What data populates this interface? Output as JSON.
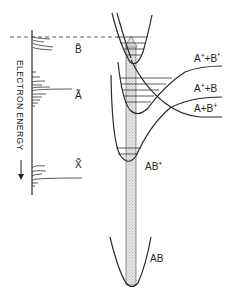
{
  "diagram": {
    "spectrum": {
      "axis_label": "ELECTRON ENERGY",
      "arrow": "down-arrow",
      "bands": [
        {
          "label": "B̃",
          "name": "B-tilde"
        },
        {
          "label": "Ã",
          "name": "A-tilde"
        },
        {
          "label": "X̃",
          "name": "X-tilde"
        }
      ]
    },
    "potential_curves": [
      {
        "label": "A",
        "sup": "+",
        "mid": "+B",
        "sup2": "*",
        "name": "A+ + B*"
      },
      {
        "label": "A",
        "sup": "+",
        "mid": "+B",
        "sup2": "",
        "name": "A+ + B"
      },
      {
        "label": "A+B",
        "sup": "+",
        "mid": "",
        "sup2": "",
        "name": "A + B+"
      },
      {
        "label": "AB",
        "sup": "+",
        "name": "AB+"
      },
      {
        "label": "AB",
        "sup": "",
        "name": "AB"
      }
    ],
    "fill_color": "#d9d9d9",
    "line_color": "#2a2a2a"
  }
}
